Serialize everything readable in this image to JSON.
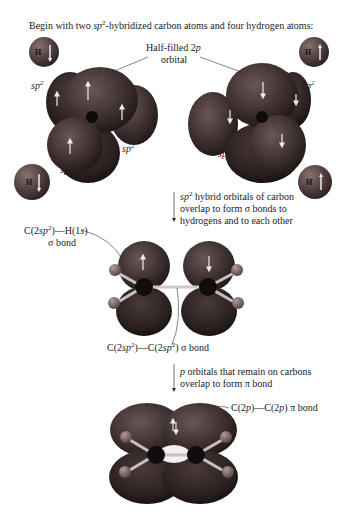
{
  "title": {
    "pre": "Begin with two ",
    "sp": "sp",
    "sup": "2",
    "post": "-hybridized carbon atoms and four hydrogen atoms:"
  },
  "labels": {
    "half_filled_1": "Half-filled 2",
    "half_filled_p": "p",
    "half_filled_2": "orbital",
    "sp": "sp",
    "sup2": "2",
    "h": "H"
  },
  "step1": {
    "line1_sp": "sp",
    "line1_sup": "2",
    "line1_rest": " hybrid orbitals of carbon",
    "line2": "overlap to form σ bonds to",
    "line3": "hydrogens and to each other"
  },
  "ch_bond": {
    "c": "C(2",
    "sp": "sp",
    "sup": "2",
    "rest": ")—H(1",
    "s": "s",
    "close": ")",
    "line2": "σ bond"
  },
  "cc_sigma": {
    "a": "C(2",
    "sp1": "sp",
    "sup1": "2",
    "b": ")—C(2",
    "sp2": "sp",
    "sup2": "2",
    "c": ") σ bond"
  },
  "step2": {
    "p": "p",
    "line1_rest": " orbitals that remain on carbons",
    "line2": "overlap to form π bond"
  },
  "pi_bond": {
    "a": "C(2",
    "p1": "p",
    "b": ")—C(2",
    "p2": "p",
    "c": ") π bond"
  },
  "colors": {
    "orbital_dark": "#3a2c2c",
    "orbital_mid": "#5a4646",
    "hydrogen": "#6e5a5a",
    "carbon": "#141010",
    "bond": "#c8c0c0"
  }
}
